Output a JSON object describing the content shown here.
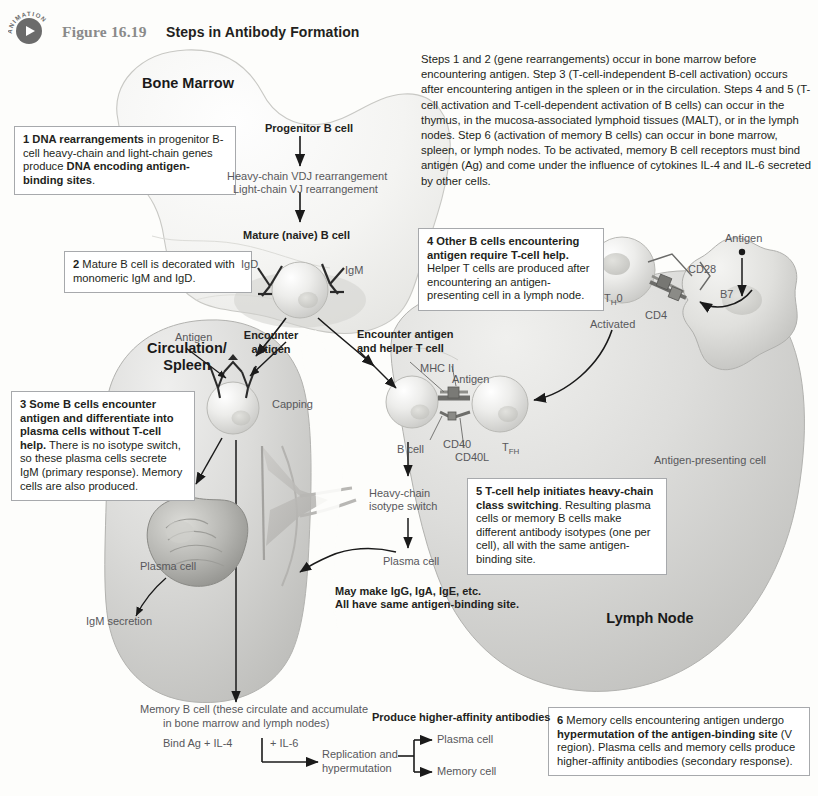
{
  "header": {
    "animation_badge_word": "ANIMATION",
    "figure_number": "Figure 16.19",
    "figure_title": "Steps in Antibody Formation"
  },
  "intro_paragraph": "Steps 1 and 2 (gene rearrangements) occur in bone marrow before encountering antigen. Step 3 (T-cell-independent B-cell activation) occurs after encountering antigen in the spleen or in the circulation. Steps 4 and 5 (T-cell activation and T-cell-dependent activation of B cells) can occur in the thymus, in the mucosa-associated lymphoid tissues (MALT), or in the lymph nodes. Step 6 (activation of memory B cells) can occur in bone marrow, spleen, or lymph nodes. To be activated, memory B cell receptors must bind antigen (Ag) and come under the influence of cytokines IL-4 and IL-6 secreted by other cells.",
  "organs": {
    "bone_marrow": "Bone Marrow",
    "circulation_spleen": "Circulation/\nSpleen",
    "lymph_node": "Lymph Node"
  },
  "steps": [
    {
      "number": "1",
      "bold_lead": "DNA rearrangements",
      "text": " in progenitor B-cell heavy-chain and light-chain genes produce ",
      "bold_tail": "DNA encoding antigen-binding sites",
      "tail": "."
    },
    {
      "number": "2",
      "bold_lead": "",
      "text": "Mature B cell is decorated with monomeric IgM and IgD.",
      "bold_tail": "",
      "tail": ""
    },
    {
      "number": "3",
      "bold_lead": "Some B cells encounter antigen and differentiate into plasma cells without T-cell help.",
      "text": " There is no isotype switch, so these plasma cells secrete IgM (primary response). Memory cells are also produced.",
      "bold_tail": "",
      "tail": ""
    },
    {
      "number": "4",
      "bold_lead": "Other B cells encountering antigen require T-cell help.",
      "text": " Helper T cells are produced after encountering an antigen-presenting cell in a lymph node.",
      "bold_tail": "",
      "tail": ""
    },
    {
      "number": "5",
      "bold_lead": "T-cell help initiates heavy-chain class switching",
      "text": ". Resulting plasma cells or memory B cells make different antibody isotypes (one per cell), all with the same antigen-binding site.",
      "bold_tail": "",
      "tail": ""
    },
    {
      "number": "6",
      "bold_lead": "",
      "text": "Memory cells encountering antigen undergo ",
      "bold_tail": "hypermutation of the antigen-binding site",
      "tail": " (V region). Plasma cells and memory cells produce higher-affinity antibodies (secondary response)."
    }
  ],
  "labels": {
    "progenitor_b_cell": "Progenitor B cell",
    "heavy_chain_vdj": "Heavy-chain VDJ rearrangement",
    "light_chain_vj": "Light-chain VJ rearrangement",
    "mature_naive_b_cell": "Mature (naive) B cell",
    "igd": "IgD",
    "igm": "IgM",
    "antigen_left": "Antigen",
    "encounter_antigen": "Encounter\nantigen",
    "capping": "Capping",
    "plasma_cell_left": "Plasma cell",
    "igm_secretion": "IgM secretion",
    "encounter_antigen_helper": "Encounter antigen\nand helper T cell",
    "mhc_ii": "MHC II",
    "antigen_mid": "Antigen",
    "cd40": "CD40",
    "cd40l": "CD40L",
    "tfh": "TFH",
    "b_cell": "B cell",
    "heavy_chain_isotype_switch": "Heavy-chain\nisotype switch",
    "plasma_cell_mid": "Plasma cell",
    "may_make_line1": "May make IgG, IgA, IgE, etc.",
    "may_make_line2": "All have same antigen-binding site.",
    "activated": "Activated",
    "th0": "TH0",
    "cd4": "CD4",
    "cd28": "CD28",
    "b7": "B7",
    "antigen_right": "Antigen",
    "antigen_presenting_cell": "Antigen-presenting cell"
  },
  "bottom_flow": {
    "memory_b_cell_line1": "Memory B cell (these circulate and accumulate",
    "memory_b_cell_line2": "in bone marrow and lymph nodes)",
    "bind_ag_il4": "Bind Ag + IL-4",
    "il6": "+ IL-6",
    "replication_line1": "Replication and",
    "replication_line2": "hypermutation",
    "produce_higher_affinity": "Produce higher-affinity antibodies",
    "plasma_cell": "Plasma cell",
    "memory_cell": "Memory cell"
  },
  "colors": {
    "page_background": "#fdfdfb",
    "organ_fill": "#d9d9d9",
    "organ_outline": "#b0b0b0",
    "cell_fill": "#e4e4e4",
    "box_border": "#a7a9ac",
    "text_gray": "#58585b",
    "text_dark": "#231f20",
    "badge_gray": "#6b6b6b"
  }
}
